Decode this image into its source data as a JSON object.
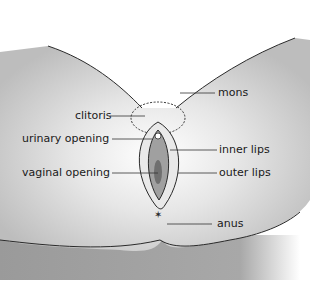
{
  "diagram": {
    "type": "anatomical-illustration",
    "labels": {
      "mons": "mons",
      "clitoris": "clitoris",
      "urinary_opening": "urinary opening",
      "vaginal_opening": "vaginal opening",
      "inner_lips": "inner lips",
      "outer_lips": "outer lips",
      "anus": "anus"
    },
    "colors": {
      "skin_shade": "#c9c9c9",
      "skin_dark": "#8f8f8f",
      "outline": "#2a2a2a",
      "inner": "#a0a0a0",
      "background": "#ffffff"
    }
  }
}
